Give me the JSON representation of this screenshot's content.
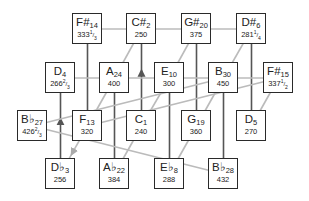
{
  "colors": {
    "box_border": "#2a2a2a",
    "major_line": "#555555",
    "minor_line": "#bbbbbb"
  },
  "nodes": [
    {
      "id": "Fs14",
      "note": "F#",
      "sub": "14",
      "freq": "333",
      "frac": "1/3"
    },
    {
      "id": "Cs2",
      "note": "C#",
      "sub": "2",
      "freq": "250",
      "frac": ""
    },
    {
      "id": "Gs20",
      "note": "G#",
      "sub": "20",
      "freq": "375",
      "frac": ""
    },
    {
      "id": "Ds6",
      "note": "D#",
      "sub": "6",
      "freq": "281",
      "frac": "1/4"
    },
    {
      "id": "D4",
      "note": "D",
      "sub": "4",
      "freq": "266",
      "frac": "2/3"
    },
    {
      "id": "A24",
      "note": "A",
      "sub": "24",
      "freq": "400",
      "frac": ""
    },
    {
      "id": "E10",
      "note": "E",
      "sub": "10",
      "freq": "300",
      "frac": ""
    },
    {
      "id": "B30",
      "note": "B",
      "sub": "30",
      "freq": "450",
      "frac": ""
    },
    {
      "id": "Fs15",
      "note": "F#",
      "sub": "15",
      "freq": "337",
      "frac": "1/2"
    },
    {
      "id": "Bb27",
      "note": "B♭",
      "sub": "27",
      "freq": "426",
      "frac": "2/3"
    },
    {
      "id": "F13",
      "note": "F",
      "sub": "13",
      "freq": "320",
      "frac": ""
    },
    {
      "id": "C1",
      "note": "C",
      "sub": "1",
      "freq": "240",
      "frac": ""
    },
    {
      "id": "G19",
      "note": "G",
      "sub": "19",
      "freq": "360",
      "frac": ""
    },
    {
      "id": "D5",
      "note": "D",
      "sub": "5",
      "freq": "270",
      "frac": ""
    },
    {
      "id": "Db3",
      "note": "D♭",
      "sub": "3",
      "freq": "256",
      "frac": ""
    },
    {
      "id": "Ab22",
      "note": "A♭",
      "sub": "22",
      "freq": "384",
      "frac": ""
    },
    {
      "id": "Eb8",
      "note": "E♭",
      "sub": "8",
      "freq": "288",
      "frac": ""
    },
    {
      "id": "Bb28",
      "note": "B♭",
      "sub": "28",
      "freq": "432",
      "frac": ""
    }
  ],
  "edges": [
    {
      "from": "Fs14",
      "to": "F13",
      "kind": "major"
    },
    {
      "from": "C1",
      "to": "Cs2",
      "kind": "major",
      "arrow": true
    },
    {
      "from": "Gs20",
      "to": "G19",
      "kind": "major"
    },
    {
      "from": "Ds6",
      "to": "D5",
      "kind": "major"
    },
    {
      "from": "Db3",
      "to": "D4",
      "kind": "major",
      "arrow": true
    },
    {
      "from": "A24",
      "to": "Ab22",
      "kind": "major"
    },
    {
      "from": "E10",
      "to": "Eb8",
      "kind": "major"
    },
    {
      "from": "B30",
      "to": "Bb28",
      "kind": "major"
    },
    {
      "from": "Cs2",
      "to": "A24",
      "kind": "minor"
    },
    {
      "from": "Gs20",
      "to": "E10",
      "kind": "minor"
    },
    {
      "from": "Ds6",
      "to": "B30",
      "kind": "minor"
    },
    {
      "from": "A24",
      "to": "F13",
      "kind": "minor"
    },
    {
      "from": "E10",
      "to": "C1",
      "kind": "minor"
    },
    {
      "from": "B30",
      "to": "G19",
      "kind": "minor"
    },
    {
      "from": "Fs15",
      "to": "D5",
      "kind": "minor"
    },
    {
      "from": "F13",
      "to": "Db3",
      "kind": "minor",
      "arrow": true
    },
    {
      "from": "C1",
      "to": "Ab22",
      "kind": "minor"
    },
    {
      "from": "G19",
      "to": "Eb8",
      "kind": "minor"
    },
    {
      "from": "Fs14",
      "to": "Ds6",
      "kind": "minor"
    },
    {
      "from": "D4",
      "to": "Fs15",
      "kind": "minor"
    },
    {
      "from": "Bb27",
      "to": "Bb28",
      "kind": "minor"
    },
    {
      "from": "Bb27",
      "to": "B30",
      "kind": "minor"
    },
    {
      "from": "F13",
      "to": "Fs15",
      "kind": "minor"
    }
  ]
}
